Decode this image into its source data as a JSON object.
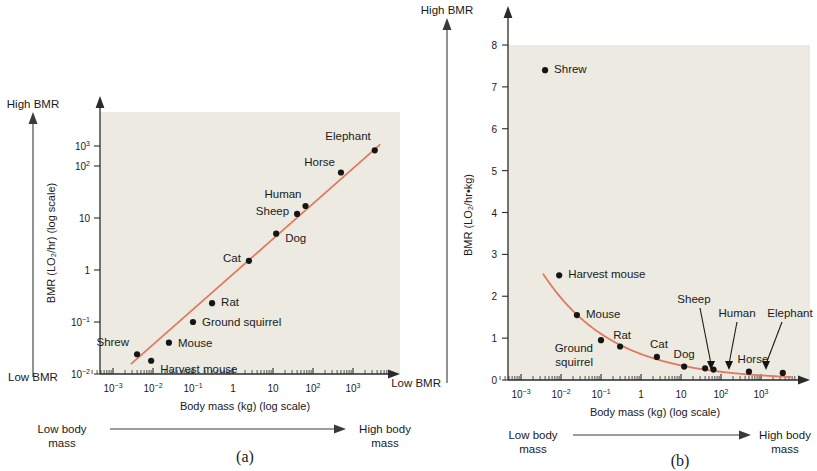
{
  "figure": {
    "panel_a_caption": "(a)",
    "panel_b_caption": "(b)"
  },
  "panel_a": {
    "high_bmr_label": "High BMR",
    "low_bmr_label": "Low BMR",
    "y_axis_title": "BMR (LO₂/hr) (log scale)",
    "x_axis_title": "Body mass (kg) (log scale)",
    "low_mass_label_l1": "Low body",
    "low_mass_label_l2": "mass",
    "high_mass_label_l1": "High body",
    "high_mass_label_l2": "mass"
  },
  "panel_b": {
    "high_bmr_label": "High BMR",
    "low_bmr_label": "Low BMR",
    "y_axis_title": "BMR (LO₂/hr•kg)",
    "x_axis_title": "Body mass (kg) (log scale)",
    "low_mass_label_l1": "Low body",
    "low_mass_label_l2": "mass",
    "high_mass_label_l1": "High body",
    "high_mass_label_l2": "mass"
  },
  "chart_data": [
    {
      "type": "scatter",
      "panel": "(a)",
      "title": "",
      "xlabel": "Body mass (kg) (log scale)",
      "ylabel": "BMR (LO₂/hr) (log scale)",
      "xscale": "log",
      "yscale": "log",
      "xlim": [
        0.0005,
        8000
      ],
      "ylim": [
        0.01,
        4000
      ],
      "xticks": [
        "10⁻³",
        "10⁻²",
        "10⁻¹",
        "1",
        "10",
        "10²",
        "10³"
      ],
      "xtick_values": [
        0.001,
        0.01,
        0.1,
        1,
        10,
        100,
        1000
      ],
      "yticks": [
        "10⁻²",
        "10⁻¹",
        "1",
        "10",
        "10²",
        "10³"
      ],
      "ytick_values": [
        0.01,
        0.1,
        1,
        10,
        100,
        1000
      ],
      "grid": false,
      "legend": "none",
      "trendline": true,
      "points": [
        {
          "label": "Shrew",
          "x": 0.004,
          "y": 0.024
        },
        {
          "label": "Harvest mouse",
          "x": 0.009,
          "y": 0.018
        },
        {
          "label": "Mouse",
          "x": 0.025,
          "y": 0.04
        },
        {
          "label": "Ground squirrel",
          "x": 0.1,
          "y": 0.1
        },
        {
          "label": "Rat",
          "x": 0.3,
          "y": 0.23
        },
        {
          "label": "Cat",
          "x": 2.5,
          "y": 1.5
        },
        {
          "label": "Dog",
          "x": 12,
          "y": 5.0
        },
        {
          "label": "Sheep",
          "x": 40,
          "y": 12
        },
        {
          "label": "Human",
          "x": 65,
          "y": 17
        },
        {
          "label": "Horse",
          "x": 500,
          "y": 75
        },
        {
          "label": "Elephant",
          "x": 3500,
          "y": 200
        }
      ]
    },
    {
      "type": "line",
      "panel": "(b)",
      "title": "",
      "xlabel": "Body mass (kg) (log scale)",
      "ylabel": "BMR (LO₂/hr•kg)",
      "xscale": "log",
      "yscale": "linear",
      "xlim": [
        0.0005,
        8000
      ],
      "ylim": [
        0,
        8
      ],
      "xticks": [
        "10⁻³",
        "10⁻²",
        "10⁻¹",
        "1",
        "10",
        "10²",
        "10³"
      ],
      "xtick_values": [
        0.001,
        0.01,
        0.1,
        1,
        10,
        100,
        1000
      ],
      "yticks": [
        "0",
        "1",
        "2",
        "3",
        "4",
        "5",
        "6",
        "7",
        "8"
      ],
      "ytick_values": [
        0,
        1,
        2,
        3,
        4,
        5,
        6,
        7,
        8
      ],
      "grid": false,
      "legend": "none",
      "trendline": true,
      "points": [
        {
          "label": "Shrew",
          "x": 0.004,
          "y": 7.4
        },
        {
          "label": "Harvest mouse",
          "x": 0.009,
          "y": 2.5
        },
        {
          "label": "Mouse",
          "x": 0.025,
          "y": 1.55
        },
        {
          "label": "Ground squirrel",
          "x": 0.1,
          "y": 0.95
        },
        {
          "label": "Rat",
          "x": 0.3,
          "y": 0.8
        },
        {
          "label": "Cat",
          "x": 2.5,
          "y": 0.55
        },
        {
          "label": "Dog",
          "x": 12,
          "y": 0.32
        },
        {
          "label": "Sheep",
          "x": 40,
          "y": 0.28
        },
        {
          "label": "Human",
          "x": 65,
          "y": 0.25
        },
        {
          "label": "Horse",
          "x": 500,
          "y": 0.2
        },
        {
          "label": "Elephant",
          "x": 3500,
          "y": 0.17
        }
      ]
    }
  ],
  "colors": {
    "trendline": "#e0795f",
    "point": "#151515",
    "axis": "#2b2b2b",
    "plot_background": "#eceae1",
    "page_background": "#ffffff"
  }
}
